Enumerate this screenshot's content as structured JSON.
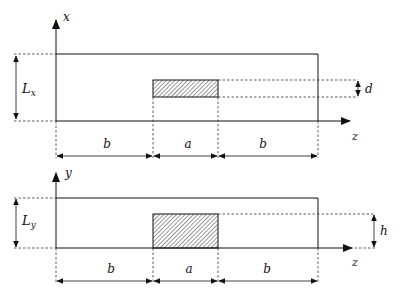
{
  "top_view": {
    "axis_vertical_label": "x",
    "axis_horizontal_label": "z",
    "height_label_main": "L",
    "height_label_sub": "x",
    "inclusion_thickness_label": "d",
    "segments": [
      "b",
      "a",
      "b"
    ]
  },
  "side_view": {
    "axis_vertical_label": "y",
    "axis_horizontal_label": "z",
    "height_label_main": "L",
    "height_label_sub": "y",
    "inclusion_height_label": "h",
    "segments": [
      "b",
      "a",
      "b"
    ]
  },
  "colors": {
    "line": "#1a1a1a",
    "dashed": "#333333",
    "hatch": "#444444"
  }
}
